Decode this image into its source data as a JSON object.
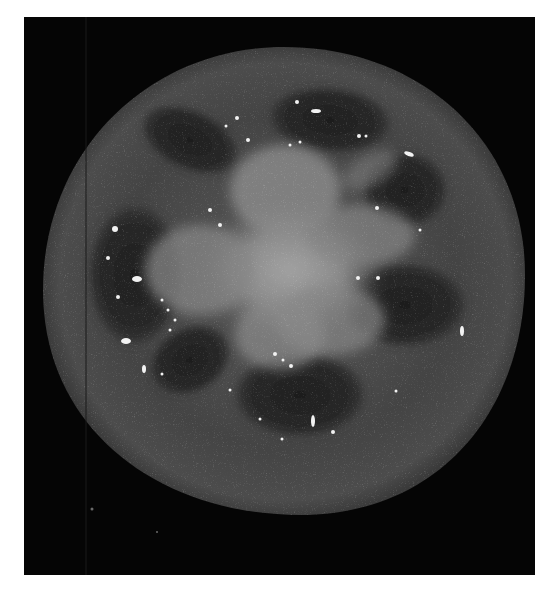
{
  "image": {
    "subject": "tomato cross-section",
    "style": "grayscale photograph",
    "alt": "Grayscale photograph of a sliced tomato showing its cross-section on a black background"
  },
  "colors": {
    "page_background": "#ffffff",
    "photo_background": "#050505",
    "pericarp": "#3e3e3e",
    "pericarp_edge": "#4a4a4a",
    "locule": "#262626",
    "placenta_core": "#9a9a9a",
    "placenta_mid": "#7c7c7c",
    "seed": "#f2f2f2"
  },
  "geometry": {
    "frame": {
      "x": 24,
      "y": 17,
      "width": 511,
      "height": 558
    },
    "tomato": {
      "cx": 284,
      "cy": 281,
      "rx": 241,
      "ry": 234
    }
  }
}
